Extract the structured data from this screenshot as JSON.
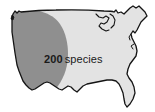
{
  "figure": {
    "type": "thematic-map",
    "background_color": "#ffffff",
    "outline_color": "#141414"
  },
  "label": {
    "count": "200",
    "unit": "species",
    "full_text": "200 species",
    "text_color": "#1a1a1a"
  },
  "regions": [
    {
      "name": "western-shaded-region",
      "fill_color": "#8f8f8f",
      "description": "dark gray shaded western area"
    },
    {
      "name": "eastern-region",
      "fill_color": "#e3e3e3",
      "description": "light gray remainder of contiguous United States"
    }
  ]
}
